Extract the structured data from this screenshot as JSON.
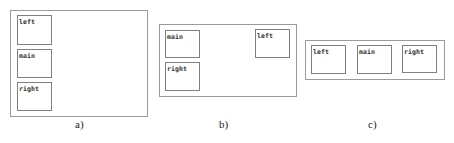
{
  "diagrams": [
    {
      "caption": "a)",
      "layout": "vertical-stack",
      "boxes": [
        {
          "label": "left"
        },
        {
          "label": "main"
        },
        {
          "label": "right"
        }
      ]
    },
    {
      "caption": "b)",
      "layout": "two-column",
      "boxes": [
        {
          "label": "main"
        },
        {
          "label": "right"
        },
        {
          "label": "left"
        }
      ]
    },
    {
      "caption": "c)",
      "layout": "horizontal-row",
      "boxes": [
        {
          "label": "left"
        },
        {
          "label": "main"
        },
        {
          "label": "right"
        }
      ]
    }
  ],
  "colors": {
    "outer_border": "#9a9a9a",
    "box_border": "#808080",
    "text": "#333333"
  }
}
